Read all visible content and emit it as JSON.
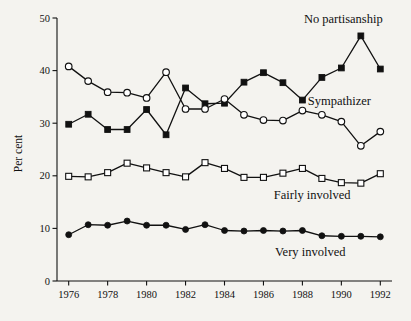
{
  "chart_data": {
    "type": "line",
    "title": "",
    "xlabel": "",
    "ylabel": "Per cent",
    "xlim": [
      1975.4,
      1992.6
    ],
    "ylim": [
      0,
      50
    ],
    "grid": false,
    "legend_position": "inline-annotations-right",
    "x": [
      1976,
      1977,
      1978,
      1979,
      1980,
      1981,
      1982,
      1983,
      1984,
      1985,
      1986,
      1987,
      1988,
      1989,
      1990,
      1991,
      1992
    ],
    "xticks": [
      1976,
      1978,
      1980,
      1982,
      1984,
      1986,
      1988,
      1990,
      1992
    ],
    "xticklabels": [
      "1976",
      "1978",
      "1980",
      "1982",
      "1984",
      "1986",
      "1988",
      "1990",
      "1992"
    ],
    "yticks": [
      0,
      10,
      20,
      30,
      40,
      50
    ],
    "yticklabels": [
      "0",
      "10",
      "20",
      "30",
      "40",
      "50"
    ],
    "series": [
      {
        "name": "No partisanship",
        "marker": "filled-square",
        "color": "#111111",
        "values": [
          29.8,
          31.7,
          28.8,
          28.8,
          32.6,
          27.8,
          36.7,
          33.7,
          33.8,
          37.8,
          39.6,
          37.7,
          34.4,
          38.7,
          40.5,
          46.6,
          40.3
        ],
        "annotation": "No partisanship",
        "annotation_x": 1990.1,
        "annotation_y": 49.0
      },
      {
        "name": "Sympathizer",
        "marker": "open-circle",
        "color": "#111111",
        "values": [
          40.8,
          38.0,
          35.9,
          35.8,
          34.8,
          39.7,
          32.7,
          32.7,
          34.6,
          31.6,
          30.6,
          30.5,
          32.4,
          31.6,
          30.3,
          25.7,
          28.4
        ],
        "annotation": "Sympathizer",
        "annotation_x": 1989.9,
        "annotation_y": 33.4
      },
      {
        "name": "Fairly involved",
        "marker": "open-square",
        "color": "#111111",
        "values": [
          19.9,
          19.8,
          20.6,
          22.4,
          21.5,
          20.6,
          19.8,
          22.5,
          21.4,
          19.7,
          19.7,
          20.5,
          21.4,
          19.5,
          18.7,
          18.6,
          20.4
        ],
        "annotation": "Fairly involved",
        "annotation_x": 1988.5,
        "annotation_y": 15.6
      },
      {
        "name": "Very involved",
        "marker": "filled-circle",
        "color": "#111111",
        "values": [
          8.8,
          10.7,
          10.6,
          11.4,
          10.6,
          10.6,
          9.8,
          10.7,
          9.6,
          9.5,
          9.6,
          9.5,
          9.6,
          8.6,
          8.5,
          8.5,
          8.4
        ],
        "annotation": "Very involved",
        "annotation_x": 1988.4,
        "annotation_y": 4.8
      }
    ]
  },
  "axes": {
    "y_axis_title": "Per cent"
  }
}
